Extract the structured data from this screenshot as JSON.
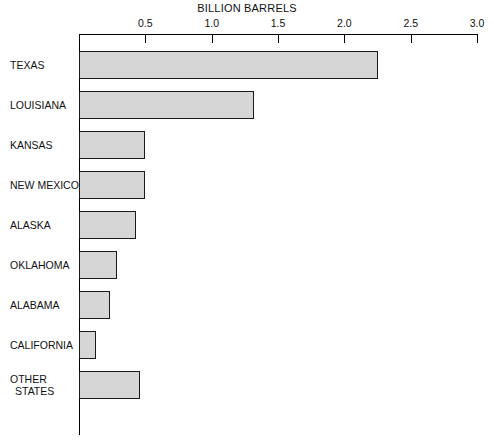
{
  "chart_data": {
    "type": "bar",
    "orientation": "horizontal",
    "title": "BILLION BARRELS",
    "xlabel": "BILLION BARRELS",
    "ylabel": "",
    "xlim": [
      0,
      3.0
    ],
    "xticks": [
      0.5,
      1.0,
      1.5,
      2.0,
      2.5,
      3.0
    ],
    "xtick_labels": [
      "0.5",
      "1.0",
      "1.5",
      "2.0",
      "2.5",
      "3.0"
    ],
    "grid": false,
    "legend": null,
    "categories": [
      "TEXAS",
      "LOUISIANA",
      "KANSAS",
      "NEW MEXICO",
      "ALASKA",
      "OKLAHOMA",
      "ALABAMA",
      "CALIFORNIA",
      "OTHER STATES"
    ],
    "category_labels": [
      {
        "line1": "TEXAS",
        "line2": ""
      },
      {
        "line1": "LOUISIANA",
        "line2": ""
      },
      {
        "line1": "KANSAS",
        "line2": ""
      },
      {
        "line1": "NEW MEXICO",
        "line2": ""
      },
      {
        "line1": "ALASKA",
        "line2": ""
      },
      {
        "line1": "OKLAHOMA",
        "line2": ""
      },
      {
        "line1": "ALABAMA",
        "line2": ""
      },
      {
        "line1": "CALIFORNIA",
        "line2": ""
      },
      {
        "line1": "OTHER",
        "line2": "STATES"
      }
    ],
    "values": [
      2.25,
      1.32,
      0.5,
      0.5,
      0.43,
      0.29,
      0.23,
      0.13,
      0.46
    ],
    "bar_fill_color": "#d6d6d6",
    "bar_edge_color": "#1a1a1a",
    "axis_color": "#000000",
    "background_color": "#ffffff"
  }
}
